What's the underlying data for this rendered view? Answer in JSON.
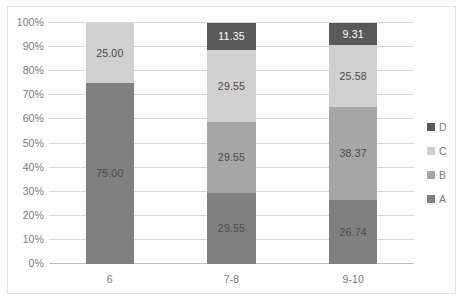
{
  "chart_data": {
    "type": "bar",
    "subtype": "100% stacked bar",
    "title": "",
    "subtitle": "",
    "xlabel": "",
    "ylabel": "",
    "categories": [
      "6",
      "7-8",
      "9-10"
    ],
    "series": [
      {
        "name": "A",
        "color": "#808080",
        "values": [
          75.0,
          29.55,
          26.74
        ],
        "labels": [
          "75.00",
          "29.55",
          "26.74"
        ]
      },
      {
        "name": "B",
        "color": "#a6a6a6",
        "values": [
          0,
          29.55,
          38.37
        ],
        "labels": [
          "",
          "29.55",
          "38.37"
        ]
      },
      {
        "name": "C",
        "color": "#d0d0d0",
        "values": [
          25.0,
          29.55,
          25.58
        ],
        "labels": [
          "25.00",
          "29.55",
          "25.58"
        ]
      },
      {
        "name": "D",
        "color": "#595959",
        "values": [
          0,
          11.35,
          9.31
        ],
        "labels": [
          "",
          "11.35",
          "9.31"
        ]
      }
    ],
    "stack_order_bottom_to_top": [
      "A",
      "B",
      "C",
      "D"
    ],
    "ylim": [
      0,
      100
    ],
    "ytick_labels": [
      "0%",
      "10%",
      "20%",
      "30%",
      "40%",
      "50%",
      "60%",
      "70%",
      "80%",
      "90%",
      "100%"
    ],
    "ytick_values": [
      0,
      10,
      20,
      30,
      40,
      50,
      60,
      70,
      80,
      90,
      100
    ],
    "grid": "horizontal",
    "legend_position": "right",
    "legend_order_top_to_bottom": [
      "D",
      "C",
      "B",
      "A"
    ],
    "value_label_format": "0.00"
  },
  "legend": {
    "items": [
      {
        "label": "D",
        "color": "#595959"
      },
      {
        "label": "C",
        "color": "#d0d0d0"
      },
      {
        "label": "B",
        "color": "#a6a6a6"
      },
      {
        "label": "A",
        "color": "#808080"
      }
    ]
  },
  "axes": {
    "y_ticks": [
      {
        "label": "100%",
        "value": 100
      },
      {
        "label": "90%",
        "value": 90
      },
      {
        "label": "80%",
        "value": 80
      },
      {
        "label": "70%",
        "value": 70
      },
      {
        "label": "60%",
        "value": 60
      },
      {
        "label": "50%",
        "value": 50
      },
      {
        "label": "40%",
        "value": 40
      },
      {
        "label": "30%",
        "value": 30
      },
      {
        "label": "20%",
        "value": 20
      },
      {
        "label": "10%",
        "value": 10
      },
      {
        "label": "0%",
        "value": 0
      }
    ],
    "x_ticks": [
      {
        "label": "6"
      },
      {
        "label": "7-8"
      },
      {
        "label": "9-10"
      }
    ]
  },
  "colors": {
    "series_a": "#808080",
    "series_b": "#a6a6a6",
    "series_c": "#d0d0d0",
    "series_d": "#595959",
    "gridline": "#d9d9d9",
    "axis": "#bfbfbf",
    "border": "#e2e2e2",
    "tick_text": "#7a7a7a",
    "label_text": "#4a4a4a",
    "label_text_on_dark": "#ffffff",
    "background": "#ffffff"
  }
}
